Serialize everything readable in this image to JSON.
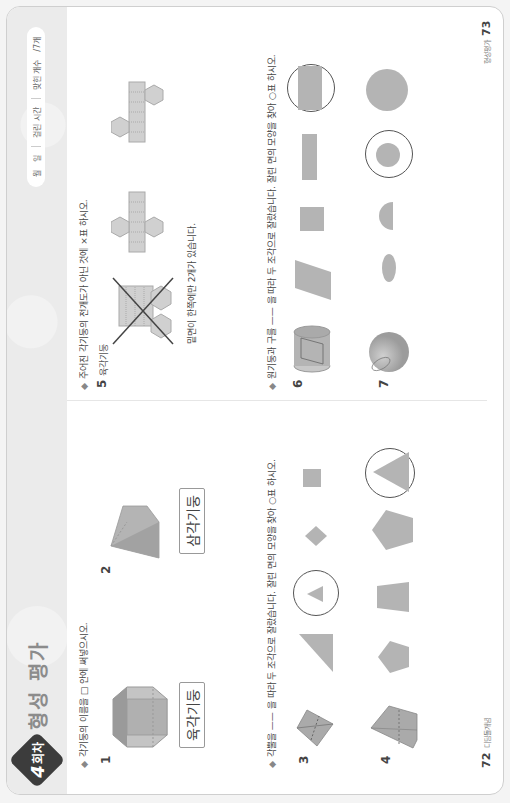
{
  "header": {
    "badge_number": "4",
    "badge_suffix": "회차",
    "title": "형성 평가",
    "score": {
      "month_label": "월",
      "day_label": "일",
      "time_label": "걸린 시간",
      "correct_label": "맞힌 개수",
      "total": "/7개"
    }
  },
  "left_page": {
    "section1": {
      "instruction": "각기둥의 이름을 □ 안에 써넣으시오.",
      "questions": [
        {
          "number": "1",
          "answer": "육각기둥",
          "shape": "hexagonal-prism"
        },
        {
          "number": "2",
          "answer": "삼각기둥",
          "shape": "triangular-prism"
        }
      ]
    },
    "section2": {
      "instruction": "각뿔을 —— 을 따라 두 조각으로 잘랐습니다. 잘린 면의 모양을 찾아 ○표 하시오.",
      "questions": [
        {
          "number": "3",
          "options": [
            "triangle",
            "triangle-small",
            "rhombus",
            "square"
          ],
          "selected_index": 1
        },
        {
          "number": "4",
          "options": [
            "pentagon",
            "trapezoid",
            "pentagon-large",
            "triangle"
          ],
          "selected_index": 3
        }
      ]
    },
    "footer": {
      "page": "72",
      "label": "디딤돌개념"
    }
  },
  "right_page": {
    "section3": {
      "instruction": "주어진 각기둥의 전개도가 아닌 것에 ×표 하시오.",
      "questions": [
        {
          "number": "5",
          "subtitle": "육각기둥",
          "nets": [
            "crossed-net",
            "net-a",
            "net-b"
          ],
          "crossed_index": 0,
          "hint": "밑면이 한쪽에만 2개가 있습니다."
        }
      ]
    },
    "section4": {
      "instruction": "원기둥과 구를 —— 을 따라 두 조각으로 잘랐습니다. 잘린 면의 모양을 찾아 ○표 하시오.",
      "questions": [
        {
          "number": "6",
          "options": [
            "parallelogram",
            "square",
            "rectangle-thin",
            "rectangle"
          ],
          "selected_index": 3
        },
        {
          "number": "7",
          "options": [
            "ellipse",
            "half-circle",
            "circle-small",
            "circle"
          ],
          "selected_index": 2
        }
      ]
    },
    "footer": {
      "page": "73",
      "label": "형성평가"
    }
  },
  "colors": {
    "shape_fill": "#b4b4b4",
    "ring": "#555555",
    "header_band": "#ebebeb",
    "badge": "#3c3c3c"
  }
}
